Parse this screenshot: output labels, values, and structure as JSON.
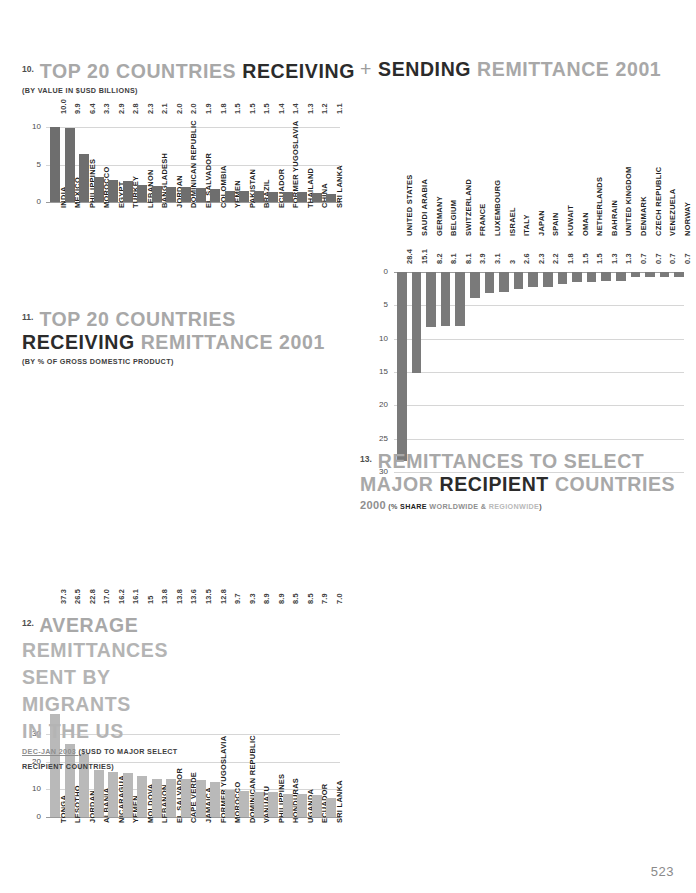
{
  "page": {
    "number": "523"
  },
  "chart10": {
    "num": "10.",
    "title_parts": [
      "TOP 20 COUNTRIES ",
      "RECEIVING"
    ],
    "subtitle": "(BY VALUE IN $USD BILLIONS)",
    "yticks": [
      "10",
      "5",
      "0"
    ]
  },
  "chart_sending": {
    "plus": "+",
    "title_parts": [
      "SENDING",
      " REMITTANCE 2001"
    ],
    "yticks": [
      "0",
      "5",
      "10",
      "15",
      "20",
      "25",
      "30"
    ]
  },
  "chart11": {
    "num": "11.",
    "title_line1": "TOP 20 COUNTRIES",
    "title_line2_dark": "RECEIVING",
    "title_line2_light": " REMITTANCE 2001",
    "subtitle": "(BY % OF GROSS DOMESTIC PRODUCT)",
    "yticks": [
      "30",
      "20",
      "10",
      "0"
    ]
  },
  "chart12": {
    "num": "12.",
    "title_lines": [
      "AVERAGE",
      "REMITTANCES",
      "SENT BY",
      "MIGRANTS",
      "IN THE US"
    ],
    "sub_date": "DEC-JAN 2003 ",
    "sub_rest": "($USD TO MAJOR SELECT",
    "sub_rest2": "RECIPIENT COUNTRIES)",
    "yticks": [
      "1200",
      "900",
      "600",
      "300",
      "0"
    ]
  },
  "chart13": {
    "num": "13.",
    "title_line1": "REMITTANCES TO SELECT",
    "title_line2_a": "MAJOR ",
    "title_line2_b": "RECIPIENT",
    "title_line2_c": " COUNTRIES",
    "sub_year": "2000",
    "sub_open": " (% ",
    "sub_share": "SHARE",
    "sub_world": " WORLDWIDE ",
    "sub_amp": "&",
    "sub_region": " REGIONWIDE",
    "sub_close": ")",
    "yticks": [
      "80",
      "70",
      "60",
      "50",
      "40",
      "30",
      "20",
      "10",
      "0"
    ]
  },
  "chart_data": [
    {
      "id": "chart10",
      "type": "bar",
      "title": "10. TOP 20 COUNTRIES RECEIVING REMITTANCE 2001",
      "xlabel": "",
      "ylabel": "$USD billions",
      "ylim": [
        0,
        11
      ],
      "grid": true,
      "categories": [
        "INDIA",
        "MEXICO",
        "PHILIPPINES",
        "MOROCCO",
        "EGYPT",
        "TURKEY",
        "LEBANON",
        "BANGLADESH",
        "JORDAN",
        "DOMINICAN REPUBLIC",
        "EL SALVADOR",
        "COLOMBIA",
        "YEMEN",
        "PAKISTAN",
        "BRAZIL",
        "ECUADOR",
        "FORMER YUGOSLAVIA",
        "THAILAND",
        "CHINA",
        "SRI LANKA"
      ],
      "values": [
        10.0,
        9.9,
        6.4,
        3.3,
        2.9,
        2.8,
        2.3,
        2.1,
        2.0,
        2.0,
        1.9,
        1.8,
        1.5,
        1.5,
        1.5,
        1.4,
        1.4,
        1.3,
        1.2,
        1.1
      ],
      "value_labels": [
        "10.0",
        "9.9",
        "6.4",
        "3.3",
        "2.9",
        "2.8",
        "2.3",
        "2.1",
        "2.0",
        "2.0",
        "1.9",
        "1.8",
        "1.5",
        "1.5",
        "1.5",
        "1.4",
        "1.4",
        "1.3",
        "1.2",
        "1.1"
      ]
    },
    {
      "id": "chart_sending",
      "type": "bar",
      "title": "+ SENDING REMITTANCE 2001",
      "xlabel": "",
      "ylabel": "$USD billions (inverted)",
      "ylim": [
        0,
        30
      ],
      "inverted": true,
      "grid": true,
      "categories": [
        "UNITED STATES",
        "SAUDI ARABIA",
        "GERMANY",
        "BELGIUM",
        "SWITZERLAND",
        "FRANCE",
        "LUXEMBOURG",
        "ISRAEL",
        "ITALY",
        "JAPAN",
        "SPAIN",
        "KUWAIT",
        "OMAN",
        "NETHERLANDS",
        "BAHRAIN",
        "UNITED KINGDOM",
        "DENMARK",
        "CZECH REPUBLIC",
        "VENEZUELA",
        "NORWAY"
      ],
      "values": [
        28.4,
        15.1,
        8.2,
        8.1,
        8.1,
        3.9,
        3.1,
        3,
        2.6,
        2.3,
        2.2,
        1.8,
        1.5,
        1.5,
        1.3,
        1.3,
        0.7,
        0.7,
        0.7,
        0.7
      ],
      "value_labels": [
        "28.4",
        "15.1",
        "8.2",
        "8.1",
        "8.1",
        "3.9",
        "3.1",
        "3",
        "2.6",
        "2.3",
        "2.2",
        "1.8",
        "1.5",
        "1.5",
        "1.3",
        "1.3",
        "0.7",
        "0.7",
        "0.7",
        "0.7"
      ]
    },
    {
      "id": "chart11",
      "type": "bar",
      "title": "11. TOP 20 COUNTRIES RECEIVING REMITTANCE 2001",
      "xlabel": "",
      "ylabel": "% of GDP",
      "ylim": [
        0,
        38
      ],
      "grid": true,
      "categories": [
        "TONGA",
        "LESOTHO",
        "JORDAN",
        "ALBANIA",
        "NICARAGUA",
        "YEMEN",
        "MOLDOVA",
        "LEBANON",
        "EL SALVADOR",
        "CAPE VERDE",
        "JAMAICA",
        "FORMER YUGOSLAVIA",
        "MOROCCO",
        "DOMINICAN REPUBLIC",
        "VANUATU",
        "PHILIPPINES",
        "HONDURAS",
        "UGANDA",
        "ECUADOR",
        "SRI LANKA"
      ],
      "values": [
        37.3,
        26.5,
        22.8,
        17.0,
        16.2,
        16.1,
        15,
        13.8,
        13.8,
        13.6,
        13.5,
        12.8,
        9.7,
        9.3,
        8.9,
        8.9,
        8.5,
        8.5,
        7.9,
        7.0
      ],
      "value_labels": [
        "37.3",
        "26.5",
        "22.8",
        "17.0",
        "16.2",
        "16.1",
        "15",
        "13.8",
        "13.8",
        "13.6",
        "13.5",
        "12.8",
        "9.7",
        "9.3",
        "8.9",
        "8.9",
        "8.5",
        "8.5",
        "7.9",
        "7.0"
      ]
    },
    {
      "id": "chart12",
      "type": "bar",
      "title": "12. AVERAGE REMITTANCES SENT BY MIGRANTS IN THE US",
      "xlabel": "",
      "ylabel": "$USD",
      "ylim": [
        0,
        1200
      ],
      "grid": true,
      "categories": [
        "INDIA",
        "PAKISTAN",
        "BANGLADESH",
        "PHILIPPINES",
        "MEXICO",
        "EGYPT",
        "EL SALVADOR",
        "DOMINICAN REPUBLIC"
      ],
      "values": [
        1104,
        790,
        562,
        397,
        385,
        307,
        280,
        203
      ],
      "value_labels": [
        "1104",
        "790",
        "562",
        "397",
        "385",
        "307",
        "280",
        "203"
      ]
    },
    {
      "id": "chart13",
      "type": "bar",
      "title": "13. REMITTANCES TO SELECT MAJOR RECIPIENT COUNTRIES 2000",
      "xlabel": "",
      "ylabel": "% share",
      "ylim": [
        0,
        80
      ],
      "grid": true,
      "legend": [
        "% SHARE WORLDWIDE",
        "% SHARE REGIONWIDE"
      ],
      "categories": [
        "YEMEN",
        "NIGERIA",
        "GREECE",
        "DOMINICAN REPUBLIC",
        "EL SALVADOR",
        "JORDAN",
        "BANGLADESH",
        "MOROCCO",
        "PORTUGAL",
        "SPAIN",
        "EGYPT",
        "TURKEY",
        "CHINA",
        "PHILIPPINES",
        "MEXICO",
        "INDIA"
      ],
      "series": [
        {
          "name": "% SHARE WORLDWIDE",
          "values": [
            2,
            2,
            2,
            2,
            2,
            2,
            2,
            3,
            4,
            4,
            5,
            6,
            8,
            8,
            8,
            15
          ],
          "labels": [
            "2%",
            "2%",
            "2%",
            "2%",
            "2%",
            "2%",
            "2%",
            "3%",
            "4%",
            "4%",
            "5%",
            "6%",
            "8%",
            "8%",
            "8%",
            "15%"
          ]
        },
        {
          "name": "% SHARE REGIONWIDE",
          "values": [
            12,
            65,
            10,
            9,
            9,
            17,
            12,
            20,
            18,
            20,
            30,
            27,
            42,
            43,
            34,
            71
          ],
          "labels": [
            "12%",
            "65%",
            "10%",
            "9%",
            "9%",
            "17%",
            "12%",
            "20%",
            "18%",
            "20%",
            "30%",
            "27%",
            "42%",
            "43%",
            "34%",
            "71%"
          ]
        }
      ]
    }
  ]
}
